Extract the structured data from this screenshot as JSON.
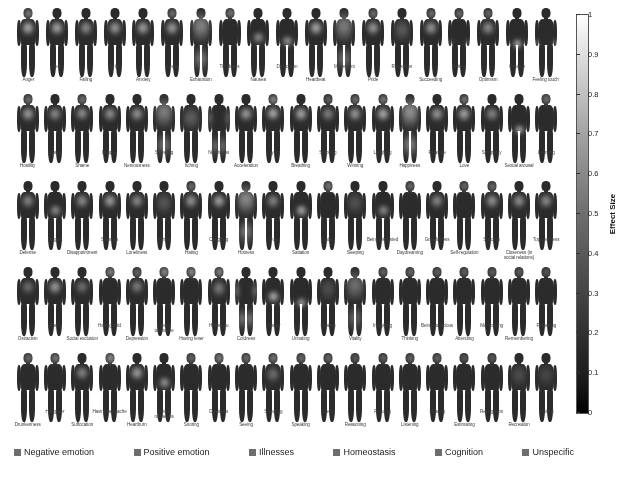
{
  "chart_data": {
    "type": "heatmap",
    "title": "",
    "subtitle": "",
    "colorbar": {
      "label": "Effect Size",
      "min": 0,
      "max": 1,
      "ticks": [
        "0",
        "0.1",
        "0.2",
        "0.3",
        "0.4",
        "0.5",
        "0.6",
        "0.7",
        "0.8",
        "0.9",
        "1"
      ],
      "low_color": "#000000",
      "high_color": "#ffffff"
    },
    "legend": {
      "position": "bottom",
      "entries": [
        {
          "label": "Negative emotion",
          "color": "#6e6e6e"
        },
        {
          "label": "Positive emotion",
          "color": "#6e6e6e"
        },
        {
          "label": "Illnesses",
          "color": "#6e6e6e"
        },
        {
          "label": "Homeostasis",
          "color": "#6e6e6e"
        },
        {
          "label": "Cognition",
          "color": "#6e6e6e"
        },
        {
          "label": "Unspecific",
          "color": "#6e6e6e"
        }
      ]
    },
    "rows": [
      {
        "index": 1,
        "cells": [
          {
            "label": "Anger",
            "pos": "lo",
            "category": "Negative emotion",
            "peak": "chest-head",
            "effect": 0.82
          },
          {
            "label": "Fear",
            "pos": "hi",
            "category": "Negative emotion",
            "peak": "chest",
            "effect": 0.78
          },
          {
            "label": "Failing",
            "pos": "lo",
            "category": "Unspecific",
            "peak": "chest",
            "effect": 0.62
          },
          {
            "label": "Grief",
            "pos": "hi",
            "category": "Negative emotion",
            "peak": "chest",
            "effect": 0.7
          },
          {
            "label": "Anxiety",
            "pos": "lo",
            "category": "Negative emotion",
            "peak": "chest",
            "effect": 0.74
          },
          {
            "label": "Stress",
            "pos": "hi",
            "category": "Negative emotion",
            "peak": "chest-head",
            "effect": 0.72
          },
          {
            "label": "Exhaustion",
            "pos": "lo",
            "category": "Homeostasis",
            "peak": "whole-body",
            "effect": 0.66
          },
          {
            "label": "Timidness",
            "pos": "hi",
            "category": "Negative emotion",
            "peak": "head",
            "effect": 0.58
          },
          {
            "label": "Nausea",
            "pos": "lo",
            "category": "Illnesses",
            "peak": "stomach",
            "effect": 0.64
          },
          {
            "label": "Defecation",
            "pos": "hi",
            "category": "Homeostasis",
            "peak": "abdomen",
            "effect": 0.69
          },
          {
            "label": "Heartbeat",
            "pos": "lo",
            "category": "Homeostasis",
            "peak": "chest",
            "effect": 0.8
          },
          {
            "label": "Movement",
            "pos": "hi",
            "category": "Unspecific",
            "peak": "whole-body",
            "effect": 0.6
          },
          {
            "label": "Pride",
            "pos": "lo",
            "category": "Positive emotion",
            "peak": "chest-head",
            "effect": 0.7
          },
          {
            "label": "Relaxation",
            "pos": "hi",
            "category": "Positive emotion",
            "peak": "diffuse",
            "effect": 0.55
          },
          {
            "label": "Succeeding",
            "pos": "lo",
            "category": "Positive emotion",
            "peak": "chest-head",
            "effect": 0.68
          },
          {
            "label": "Writing",
            "pos": "hi",
            "category": "Cognition",
            "peak": "head-hands",
            "effect": 0.52
          },
          {
            "label": "Optimism",
            "pos": "lo",
            "category": "Positive emotion",
            "peak": "chest-head",
            "effect": 0.63
          },
          {
            "label": "Orgasm",
            "pos": "hi",
            "category": "Homeostasis",
            "peak": "pelvis",
            "effect": 0.88
          },
          {
            "label": "Feeling touch",
            "pos": "lo",
            "category": "Unspecific",
            "peak": "hands",
            "effect": 0.57
          }
        ]
      },
      {
        "index": 2,
        "cells": [
          {
            "label": "Hostility",
            "pos": "lo",
            "category": "Negative emotion",
            "peak": "chest-head",
            "effect": 0.72
          },
          {
            "label": "Losing",
            "pos": "hi",
            "category": "Negative emotion",
            "peak": "chest",
            "effect": 0.6
          },
          {
            "label": "Shame",
            "pos": "lo",
            "category": "Negative emotion",
            "peak": "head-chest",
            "effect": 0.66
          },
          {
            "label": "Despair",
            "pos": "hi",
            "category": "Negative emotion",
            "peak": "chest",
            "effect": 0.64
          },
          {
            "label": "Nervousness",
            "pos": "lo",
            "category": "Negative emotion",
            "peak": "chest",
            "effect": 0.67
          },
          {
            "label": "Shivering",
            "pos": "hi",
            "category": "Homeostasis",
            "peak": "whole-body",
            "effect": 0.62
          },
          {
            "label": "Itching",
            "pos": "lo",
            "category": "Illnesses",
            "peak": "skin",
            "effect": 0.5
          },
          {
            "label": "Numbness",
            "pos": "hi",
            "category": "Illnesses",
            "peak": "limbs",
            "effect": 0.48
          },
          {
            "label": "Acceleration",
            "pos": "lo",
            "category": "Homeostasis",
            "peak": "chest",
            "effect": 0.71
          },
          {
            "label": "Crying",
            "pos": "hi",
            "category": "Negative emotion",
            "peak": "head-chest",
            "effect": 0.84
          },
          {
            "label": "Breathing",
            "pos": "lo",
            "category": "Homeostasis",
            "peak": "chest",
            "effect": 0.79
          },
          {
            "label": "Smoking",
            "pos": "hi",
            "category": "Unspecific",
            "peak": "chest-head",
            "effect": 0.54
          },
          {
            "label": "Winning",
            "pos": "lo",
            "category": "Positive emotion",
            "peak": "chest-head",
            "effect": 0.7
          },
          {
            "label": "Laughing",
            "pos": "hi",
            "category": "Positive emotion",
            "peak": "chest-head",
            "effect": 0.81
          },
          {
            "label": "Happiness",
            "pos": "lo",
            "category": "Positive emotion",
            "peak": "whole-body",
            "effect": 0.76
          },
          {
            "label": "Pleasure",
            "pos": "hi",
            "category": "Positive emotion",
            "peak": "chest",
            "effect": 0.69
          },
          {
            "label": "Love",
            "pos": "lo",
            "category": "Positive emotion",
            "peak": "chest-head",
            "effect": 0.78
          },
          {
            "label": "Sympathy",
            "pos": "hi",
            "category": "Positive emotion",
            "peak": "chest",
            "effect": 0.58
          },
          {
            "label": "Sexual arousal",
            "pos": "lo",
            "category": "Homeostasis",
            "peak": "pelvis",
            "effect": 0.86
          },
          {
            "label": "Learning",
            "pos": "hi",
            "category": "Cognition",
            "peak": "head",
            "effect": 0.55
          }
        ]
      },
      {
        "index": 3,
        "cells": [
          {
            "label": "Defense",
            "pos": "lo",
            "category": "Unspecific",
            "peak": "chest",
            "effect": 0.56
          },
          {
            "label": "Disgust",
            "pos": "hi",
            "category": "Negative emotion",
            "peak": "stomach",
            "effect": 0.63
          },
          {
            "label": "Disappointment",
            "pos": "lo",
            "category": "Negative emotion",
            "peak": "chest",
            "effect": 0.61
          },
          {
            "label": "Sadness",
            "pos": "hi",
            "category": "Negative emotion",
            "peak": "chest",
            "effect": 0.73
          },
          {
            "label": "Loneliness",
            "pos": "lo",
            "category": "Negative emotion",
            "peak": "chest",
            "effect": 0.6
          },
          {
            "label": "Aching",
            "pos": "hi",
            "category": "Illnesses",
            "peak": "diffuse",
            "effect": 0.52
          },
          {
            "label": "Hating",
            "pos": "lo",
            "category": "Negative emotion",
            "peak": "chest-head",
            "effect": 0.67
          },
          {
            "label": "Coughing",
            "pos": "hi",
            "category": "Illnesses",
            "peak": "chest",
            "effect": 0.75
          },
          {
            "label": "Hotness",
            "pos": "lo",
            "category": "Homeostasis",
            "peak": "whole-body",
            "effect": 0.7
          },
          {
            "label": "Trust",
            "pos": "hi",
            "category": "Positive emotion",
            "peak": "chest",
            "effect": 0.57
          },
          {
            "label": "Satiation",
            "pos": "lo",
            "category": "Homeostasis",
            "peak": "stomach",
            "effect": 0.82
          },
          {
            "label": "Tasting",
            "pos": "hi",
            "category": "Unspecific",
            "peak": "head",
            "effect": 0.6
          },
          {
            "label": "Sleeping",
            "pos": "lo",
            "category": "Homeostasis",
            "peak": "diffuse",
            "effect": 0.45
          },
          {
            "label": "Being disgusted",
            "pos": "hi",
            "category": "Negative emotion",
            "peak": "stomach",
            "effect": 0.62
          },
          {
            "label": "Daydreaming",
            "pos": "lo",
            "category": "Cognition",
            "peak": "head",
            "effect": 0.5
          },
          {
            "label": "Gratefulness",
            "pos": "hi",
            "category": "Positive emotion",
            "peak": "chest",
            "effect": 0.59
          },
          {
            "label": "Self-regulation",
            "pos": "lo",
            "category": "Cognition",
            "peak": "head",
            "effect": 0.48
          },
          {
            "label": "Success",
            "pos": "hi",
            "category": "Positive emotion",
            "peak": "chest-head",
            "effect": 0.66
          },
          {
            "label": "Closeness (in social relations)",
            "pos": "lo",
            "category": "Positive emotion",
            "peak": "chest",
            "effect": 0.64
          },
          {
            "label": "Togetherness",
            "pos": "hi",
            "category": "Positive emotion",
            "peak": "chest",
            "effect": 0.61
          }
        ]
      },
      {
        "index": 4,
        "cells": [
          {
            "label": "Ostracism",
            "pos": "lo",
            "category": "Negative emotion",
            "peak": "chest",
            "effect": 0.42
          },
          {
            "label": "Panic",
            "pos": "hi",
            "category": "Negative emotion",
            "peak": "chest",
            "effect": 0.71
          },
          {
            "label": "Social exclusion",
            "pos": "lo",
            "category": "Negative emotion",
            "peak": "chest",
            "effect": 0.44
          },
          {
            "label": "Having cold",
            "pos": "hi",
            "category": "Illnesses",
            "peak": "head",
            "effect": 0.68
          },
          {
            "label": "Depression",
            "pos": "lo",
            "category": "Negative emotion",
            "peak": "head-chest",
            "effect": 0.55
          },
          {
            "label": "Having toothache",
            "pos": "hi",
            "category": "Illnesses",
            "peak": "head",
            "effect": 0.77
          },
          {
            "label": "Having fever",
            "pos": "lo",
            "category": "Illnesses",
            "peak": "head",
            "effect": 0.74
          },
          {
            "label": "Having flu",
            "pos": "hi",
            "category": "Illnesses",
            "peak": "head-body",
            "effect": 0.69
          },
          {
            "label": "Coldness",
            "pos": "lo",
            "category": "Homeostasis",
            "peak": "limbs",
            "effect": 0.58
          },
          {
            "label": "Hunger",
            "pos": "hi",
            "category": "Homeostasis",
            "peak": "stomach",
            "effect": 0.85
          },
          {
            "label": "Urinating",
            "pos": "lo",
            "category": "Homeostasis",
            "peak": "pelvis",
            "effect": 0.83
          },
          {
            "label": "Healing",
            "pos": "hi",
            "category": "Unspecific",
            "peak": "diffuse",
            "effect": 0.4
          },
          {
            "label": "Vitality",
            "pos": "lo",
            "category": "Positive emotion",
            "peak": "whole-body",
            "effect": 0.52
          },
          {
            "label": "Imagining",
            "pos": "hi",
            "category": "Cognition",
            "peak": "head",
            "effect": 0.46
          },
          {
            "label": "Thinking",
            "pos": "lo",
            "category": "Cognition",
            "peak": "head",
            "effect": 0.49
          },
          {
            "label": "Being conscious",
            "pos": "hi",
            "category": "Cognition",
            "peak": "head",
            "effect": 0.44
          },
          {
            "label": "Attending",
            "pos": "lo",
            "category": "Cognition",
            "peak": "head",
            "effect": 0.43
          },
          {
            "label": "Memorizing",
            "pos": "hi",
            "category": "Cognition",
            "peak": "head",
            "effect": 0.41
          },
          {
            "label": "Remembering",
            "pos": "lo",
            "category": "Cognition",
            "peak": "head",
            "effect": 0.4
          },
          {
            "label": "Forgetting",
            "pos": "hi",
            "category": "Cognition",
            "peak": "head",
            "effect": 0.36
          }
        ]
      },
      {
        "index": 5,
        "cells": [
          {
            "label": "Drunkenness",
            "pos": "lo",
            "category": "Unspecific",
            "peak": "head",
            "effect": 0.5
          },
          {
            "label": "Hangover",
            "pos": "hi",
            "category": "Illnesses",
            "peak": "head",
            "effect": 0.62
          },
          {
            "label": "Suffocation",
            "pos": "lo",
            "category": "Illnesses",
            "peak": "chest",
            "effect": 0.56
          },
          {
            "label": "Having headache",
            "pos": "hi",
            "category": "Illnesses",
            "peak": "head",
            "effect": 0.79
          },
          {
            "label": "Heartburn",
            "pos": "lo",
            "category": "Illnesses",
            "peak": "chest",
            "effect": 0.72
          },
          {
            "label": "Feeling nauseous",
            "pos": "hi",
            "category": "Illnesses",
            "peak": "stomach",
            "effect": 0.7
          },
          {
            "label": "Snoring",
            "pos": "lo",
            "category": "Homeostasis",
            "peak": "head",
            "effect": 0.47
          },
          {
            "label": "Dizziness",
            "pos": "hi",
            "category": "Illnesses",
            "peak": "head",
            "effect": 0.65
          },
          {
            "label": "Seeing",
            "pos": "lo",
            "category": "Unspecific",
            "peak": "head",
            "effect": 0.53
          },
          {
            "label": "Sweating",
            "pos": "hi",
            "category": "Homeostasis",
            "peak": "head-body",
            "effect": 0.6
          },
          {
            "label": "Speaking",
            "pos": "lo",
            "category": "Unspecific",
            "peak": "head",
            "effect": 0.51
          },
          {
            "label": "Seeing",
            "pos": "hi",
            "category": "Unspecific",
            "peak": "head",
            "effect": 0.49
          },
          {
            "label": "Reasoning",
            "pos": "lo",
            "category": "Cognition",
            "peak": "head",
            "effect": 0.38
          },
          {
            "label": "Reading",
            "pos": "hi",
            "category": "Cognition",
            "peak": "head",
            "effect": 0.42
          },
          {
            "label": "Listening",
            "pos": "lo",
            "category": "Unspecific",
            "peak": "head",
            "effect": 0.45
          },
          {
            "label": "Hearing",
            "pos": "hi",
            "category": "Unspecific",
            "peak": "head",
            "effect": 0.46
          },
          {
            "label": "Estimating",
            "pos": "lo",
            "category": "Cognition",
            "peak": "head",
            "effect": 0.35
          },
          {
            "label": "Recognition",
            "pos": "hi",
            "category": "Cognition",
            "peak": "head",
            "effect": 0.37
          },
          {
            "label": "Recreation",
            "pos": "lo",
            "category": "Positive emotion",
            "peak": "diffuse",
            "effect": 0.39
          },
          {
            "label": "Waiting",
            "pos": "hi",
            "category": "Unspecific",
            "peak": "diffuse",
            "effect": 0.33
          }
        ]
      }
    ]
  },
  "footer": {
    "caption": ""
  }
}
